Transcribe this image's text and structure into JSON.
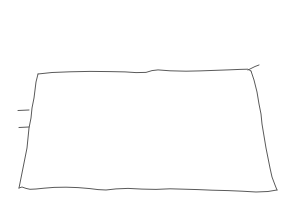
{
  "canvas": {
    "width": 293,
    "height": 220,
    "background_color": "#ffffff",
    "title": "Hand-drawn quadrilateral sketch"
  },
  "drawing": {
    "name": "hand-drawn-rectangle",
    "description": "A single hand-sketched closed quadrilateral resembling a rectangle drawn in perspective, with wobbly freehand edges",
    "stroke_color": "#5a5a5a",
    "stroke_width": 1,
    "fill": "none",
    "corners": {
      "top_left": [
        38,
        74
      ],
      "top_right": [
        251,
        71
      ],
      "bottom_right": [
        277,
        190
      ],
      "bottom_left": [
        19,
        188
      ]
    },
    "strokes": [
      {
        "name": "top-edge",
        "path": "M 38 74 L 52 72.5 L 70 71.8 L 90 71.4 L 110 71.6 L 125 71.9 L 136 72.6 L 146 72.4 L 152 70.6 L 158 69.9 L 170 70.8 L 186 71.2 L 200 70.9 L 214 70.4 L 228 69.9 L 240 69.4 L 248 69.2 L 251 71"
      },
      {
        "name": "right-edge",
        "path": "M 251 71 L 254 80 L 257 92 L 259 104 L 261 114 L 262 124 L 264 136 L 266 148 L 268 158 L 270 168 L 272 177 L 275 185 L 277 190"
      },
      {
        "name": "bottom-edge",
        "path": "M 277 190 L 268 191.5 L 256 192 L 242 191.2 L 228 190.6 L 212 190.2 L 198 189.6 L 184 189.2 L 170 188.8 L 156 189.4 L 142 189.1 L 128 188.4 L 116 188.9 L 106 190 L 98 189.6 L 90 188.6 L 78 187.6 L 66 187.2 L 54 187.4 L 44 188.2 L 36 189 L 30 189.3 L 26 188.4 L 22 187 L 19 188"
      },
      {
        "name": "left-edge",
        "path": "M 19 188 L 21 178 L 23 168 L 25 158 L 27 148 L 28 138 L 29 128 L 31 118 L 32 108 L 34 98 L 35 90 L 36 82 L 38 74"
      },
      {
        "name": "tick-spur-upper",
        "path": "M 18 110.5 L 29 110"
      },
      {
        "name": "tick-spur-lower",
        "path": "M 19 127.5 L 29 127"
      },
      {
        "name": "corner-overshoot-tail",
        "path": "M 248 70 L 255 66.5 L 259 65"
      }
    ]
  }
}
